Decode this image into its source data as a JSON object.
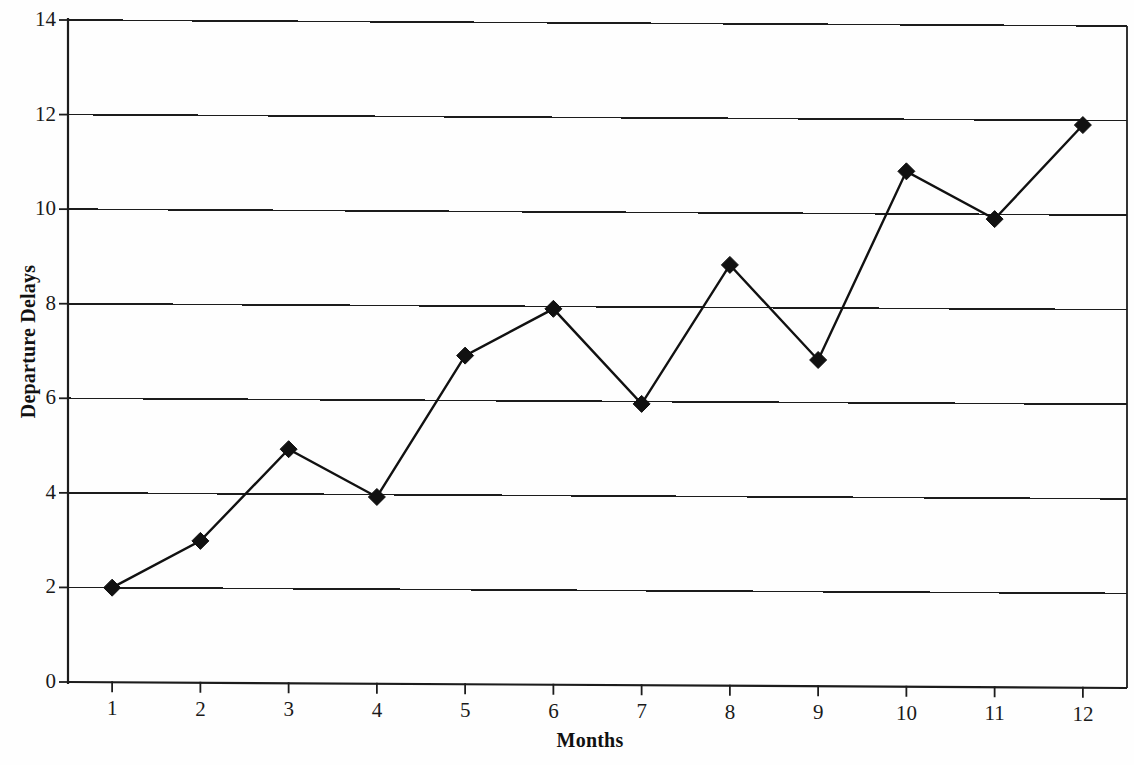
{
  "chart_data": {
    "type": "line",
    "title": "",
    "xlabel": "Months",
    "ylabel": "Departure Delays",
    "x": [
      1,
      2,
      3,
      4,
      5,
      6,
      7,
      8,
      9,
      10,
      11,
      12
    ],
    "xtick_labels": [
      "1",
      "2",
      "3",
      "4",
      "5",
      "6",
      "7",
      "8",
      "9",
      "10",
      "11",
      "12"
    ],
    "ytick_labels": [
      "0",
      "2",
      "4",
      "6",
      "8",
      "10",
      "12",
      "14"
    ],
    "ytick_values": [
      0,
      2,
      4,
      6,
      8,
      10,
      12,
      14
    ],
    "values": [
      2.0,
      3.0,
      4.95,
      3.95,
      6.95,
      7.95,
      5.95,
      8.9,
      6.9,
      10.9,
      9.9,
      11.9
    ],
    "series": [
      {
        "name": "Departure Delays",
        "values": [
          2.0,
          3.0,
          4.95,
          3.95,
          6.95,
          7.95,
          5.95,
          8.9,
          6.9,
          10.9,
          9.9,
          11.9
        ]
      }
    ],
    "xlim": [
      0.5,
      12.5
    ],
    "ylim": [
      0,
      14
    ],
    "grid": "horizontal",
    "legend": "none",
    "marker": "diamond",
    "line_color": "#111111",
    "marker_color": "#111111",
    "grid_color": "#1c1c1c",
    "background_color": "#fefefe"
  }
}
